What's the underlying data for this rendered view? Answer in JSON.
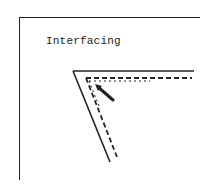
{
  "diagram": {
    "label": "Interfacing",
    "colors": {
      "ink": "#222222",
      "background": "#ffffff"
    }
  }
}
